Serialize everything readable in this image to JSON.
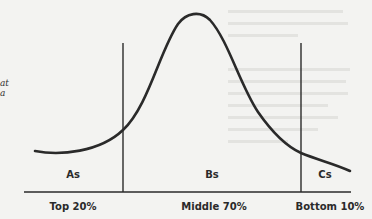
{
  "diagram": {
    "type": "distribution-curve",
    "regions": [
      {
        "label": "As",
        "axis_label": "Top 20%"
      },
      {
        "label": "Bs",
        "axis_label": "Middle 70%"
      },
      {
        "label": "Cs",
        "axis_label": "Bottom 10%"
      }
    ],
    "left_margin_fragments": [
      "at",
      "a"
    ],
    "colors": {
      "ink": "#2a2a2a",
      "paper": "#f3f3f1"
    }
  }
}
